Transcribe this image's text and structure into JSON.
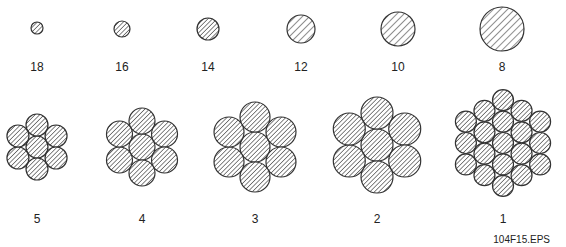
{
  "figure": {
    "file_label": "104F15.EPS",
    "colors": {
      "stroke": "#333333",
      "fill": "#ffffff",
      "hatch": "#444444"
    }
  },
  "solid_wires": [
    {
      "gauge": "18",
      "cx": 37,
      "cy": 28,
      "r": 6
    },
    {
      "gauge": "16",
      "cx": 122,
      "cy": 29,
      "r": 8
    },
    {
      "gauge": "14",
      "cx": 208,
      "cy": 29,
      "r": 11
    },
    {
      "gauge": "12",
      "cx": 301,
      "cy": 29,
      "r": 14
    },
    {
      "gauge": "10",
      "cx": 398,
      "cy": 29,
      "r": 17
    },
    {
      "gauge": "8",
      "cx": 502,
      "cy": 29,
      "r": 22
    }
  ],
  "stranded_wires": [
    {
      "gauge": "5",
      "cx": 37,
      "cy": 147,
      "r": 11,
      "strands": 7
    },
    {
      "gauge": "4",
      "cx": 142,
      "cy": 147,
      "r": 13,
      "strands": 7
    },
    {
      "gauge": "3",
      "cx": 255,
      "cy": 147,
      "r": 15,
      "strands": 7
    },
    {
      "gauge": "2",
      "cx": 377,
      "cy": 145,
      "r": 16,
      "strands": 7
    },
    {
      "gauge": "1",
      "cx": 503,
      "cy": 143,
      "r": 10.5,
      "strands": 19
    }
  ],
  "label_rows": {
    "top_y": 60,
    "bottom_y": 212
  }
}
